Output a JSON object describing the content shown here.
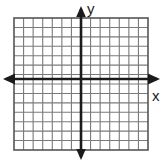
{
  "figure": {
    "kind": "cartesian-coordinate-grid",
    "background_color": "#ffffff",
    "width": 166,
    "height": 163
  },
  "labels": {
    "y_axis": "y",
    "x_axis": "x"
  },
  "icons": {
    "arrow_up": "arrow-up-icon",
    "arrow_down": "arrow-down-icon",
    "arrow_left": "arrow-left-icon",
    "arrow_right": "arrow-right-icon"
  },
  "chart_data": {
    "type": "scatter",
    "title": "",
    "subtitle": "",
    "xlabel": "x",
    "ylabel": "y",
    "grid": true,
    "legend": null,
    "legend_position": "none",
    "series": [],
    "x": [],
    "values": [],
    "annotations": [],
    "tick_labels_x": [],
    "tick_labels_y": [],
    "xlim": [
      -7,
      7
    ],
    "ylim": [
      -7,
      7
    ],
    "x_tick_step": 1,
    "y_tick_step": 1,
    "columns": 14,
    "rows": 14,
    "origin_column_index": 7,
    "origin_row_index": 7,
    "axes_arrows": [
      "left",
      "right",
      "up",
      "down"
    ],
    "note": "Empty coordinate plane: 14 by 14 unit grid with no plotted data points or tick numbers."
  },
  "geometry": {
    "grid_left": 14,
    "grid_top": 18,
    "grid_right": 148,
    "grid_bottom": 150,
    "cell_width": 9.571,
    "cell_height": 9.429,
    "y_axis_x": 81,
    "x_axis_y": 79,
    "arrow_up_tip_y": 6,
    "arrow_down_tip_y": 160,
    "arrow_left_tip_x": 3,
    "arrow_right_tip_x": 160
  },
  "colors": {
    "grid_line": "#7a7a7a",
    "grid_border": "#555555",
    "axis": "#1b1b1b",
    "label": "#1b1b1b",
    "background": "#ffffff"
  }
}
